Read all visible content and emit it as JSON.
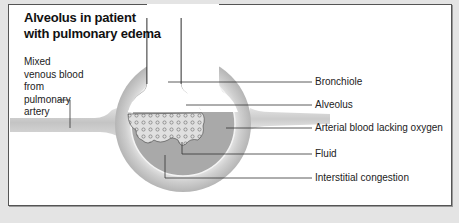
{
  "title": "Alveolus in patient with pulmonary edema",
  "labels": {
    "mixed_venous": "Mixed venous blood from pulmonary artery",
    "bronchiole": "Bronchiole",
    "alveolus": "Alveolus",
    "arterial_blood": "Arterial blood lacking oxygen",
    "fluid": "Fluid",
    "interstitial": "Interstitial congestion"
  },
  "colors": {
    "background": "#e4e4e4",
    "panel": "#ffffff",
    "vessel": "#c8c8c8",
    "interstitial": "#a8a8a8",
    "fluid": "#dcdcdc",
    "leader_line": "#333333"
  }
}
